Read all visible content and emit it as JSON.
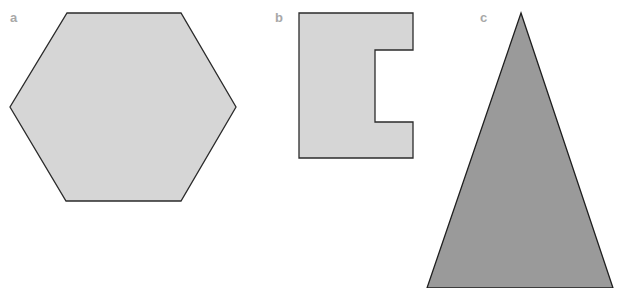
{
  "figure": {
    "panels": [
      {
        "label": "a",
        "shape": "hexagon",
        "fill": "#d6d6d6",
        "stroke": "#2b2b2b",
        "points": "67,13 181,13 236,107 181,201 66,201 10,107"
      },
      {
        "label": "b",
        "shape": "notched-rectangle",
        "fill": "#d6d6d6",
        "stroke": "#2b2b2b",
        "points": "299,13 413,13 413,50 375,50 375,122 413,122 413,158 299,158"
      },
      {
        "label": "c",
        "shape": "isosceles-triangle",
        "fill": "#9a9a9a",
        "stroke": "#1f1f1f",
        "points": "521,13 613,288 427,288"
      }
    ]
  }
}
